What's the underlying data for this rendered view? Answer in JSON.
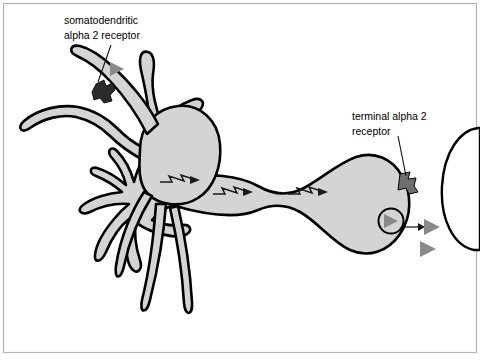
{
  "figure": {
    "background_color": "#ffffff",
    "frame_color": "#b4b4b4",
    "cell_fill": "#d4d4d4",
    "cell_stroke": "#000000",
    "receptor_dark_color": "#2b2b2b",
    "receptor_gray_color": "#6e6e6e",
    "neurotransmitter_color": "#8a8a8a",
    "postsynaptic_fill": "#ffffff"
  },
  "labels": {
    "somatodendritic": {
      "line1": "somatodendritic",
      "line2": "alpha 2 receptor"
    },
    "terminal": {
      "line1": "terminal alpha 2",
      "line2": "receptor"
    }
  },
  "elements": {
    "soma_name": "cell body",
    "dendrite_name": "dendrite",
    "axon_name": "axon",
    "terminal_name": "axon terminal",
    "vesicle_name": "synaptic vesicle",
    "postsynaptic_name": "postsynaptic cell",
    "action_potential_name": "action potential",
    "release_arrow_name": "neurotransmitter release arrow"
  },
  "counts": {
    "action_potentials": 3,
    "released_transmitters": 2,
    "receptors": 2
  }
}
